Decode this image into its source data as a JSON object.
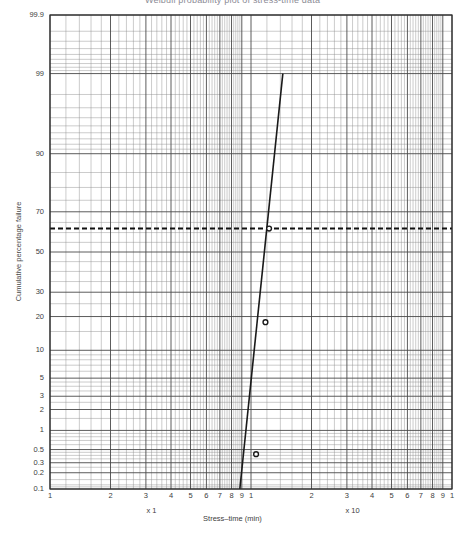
{
  "page": {
    "title_clipped": "Weibull probability plot of stress-time data",
    "footer_clipped": ""
  },
  "axes": {
    "y_title": "Cumulative percentage failure",
    "x_title": "Stress–time (min)",
    "y_ticks": [
      "99.9",
      "99",
      "90",
      "70",
      "50",
      "30",
      "20",
      "10",
      "5",
      "3",
      "2",
      "1",
      "0.5",
      "0.3",
      "0.2",
      "0.1"
    ],
    "x_ticks_decade1": [
      "1",
      "2",
      "3",
      "4",
      "5",
      "6",
      "7",
      "8",
      "9"
    ],
    "x_ticks_decade2": [
      "1",
      "2",
      "3",
      "4",
      "5",
      "6",
      "7",
      "8",
      "9"
    ],
    "x_tick_end": "1",
    "x_multiplier_1": "x 1",
    "x_multiplier_2": "x 10"
  },
  "chart_data": {
    "type": "scatter",
    "title": "Weibull probability plot of stress-time data",
    "xlabel": "Stress–time (min)",
    "ylabel": "Cumulative percentage failure",
    "x_scale": "log",
    "y_scale": "probability",
    "xlim": [
      1,
      100
    ],
    "ylim": [
      0.1,
      99.9
    ],
    "grid": true,
    "legend": null,
    "series": [
      {
        "name": "Fitted line",
        "type": "line",
        "x": [
          8.8,
          14.4
        ],
        "y": [
          0.1,
          99.0
        ],
        "style": "solid",
        "color": "#1a1a1a"
      },
      {
        "name": "Data points",
        "type": "scatter",
        "marker": "open-circle",
        "x": [
          10.6,
          11.8,
          12.3
        ],
        "y": [
          0.42,
          18.0,
          62.0
        ],
        "color": "#1a1a1a"
      }
    ],
    "annotations": [
      {
        "type": "hline",
        "label": "63.2% characteristic life reference",
        "y": 62.0,
        "style": "dashed",
        "color": "#111111"
      }
    ],
    "x_multipliers": [
      {
        "label": "x 1",
        "decade": 1
      },
      {
        "label": "x 10",
        "decade": 2
      }
    ]
  },
  "colors": {
    "grid_major": "#4a4a4a",
    "grid_minor": "#8d8d8d",
    "frame": "#2b2b2b",
    "data": "#111111",
    "background": "#ffffff"
  }
}
